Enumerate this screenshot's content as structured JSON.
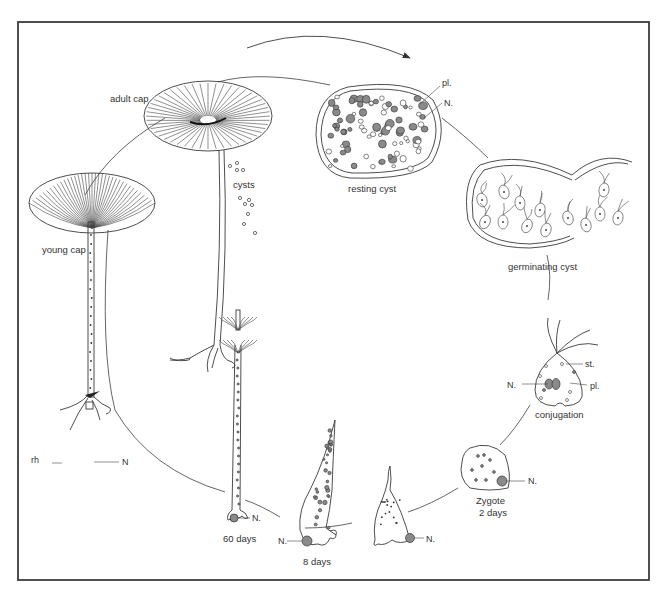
{
  "figure": {
    "type": "life-cycle diagram",
    "stages": [
      {
        "id": "young-cap",
        "label": "young cap"
      },
      {
        "id": "adult-cap",
        "label": "adult cap"
      },
      {
        "id": "cysts",
        "label": "cysts"
      },
      {
        "id": "resting-cyst",
        "label": "resting cyst"
      },
      {
        "id": "germinating-cyst",
        "label": "germinating cyst"
      },
      {
        "id": "conjugation",
        "label": "conjugation"
      },
      {
        "id": "zygote",
        "label": "Zygote",
        "sublabel": "2 days"
      },
      {
        "id": "eight-days",
        "label": "8 days"
      },
      {
        "id": "sixty-days",
        "label": "60 days"
      }
    ],
    "annotations": {
      "rhizoid": "rh",
      "nucleus_plain": "N",
      "nucleus": "N.",
      "plastid": "pl.",
      "stigma": "st."
    },
    "colors": {
      "line": "#3a3a3a",
      "fill_dark": "#8a8a8a",
      "frame": "#3c3c3c",
      "background": "#ffffff"
    }
  }
}
